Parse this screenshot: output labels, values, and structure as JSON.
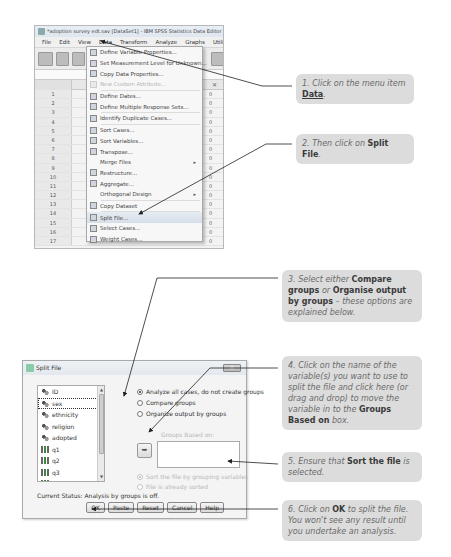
{
  "spss_window": {
    "title": "*adoption survey edt.sav [DataSet1] - IBM SPSS Statistics Data Editor",
    "menubar": [
      "File",
      "Edit",
      "View",
      "Data",
      "Transform",
      "Analyze",
      "Graphs",
      "Utilities",
      "Add-"
    ],
    "active_menu": "Data",
    "row_numbers": [
      "1",
      "2",
      "3",
      "4",
      "5",
      "6",
      "7",
      "8",
      "9",
      "10",
      "11",
      "12",
      "13",
      "14",
      "15",
      "16",
      "17"
    ],
    "row_value_suffix": "0"
  },
  "data_menu": {
    "items": [
      {
        "label": "Define Variable Properties...",
        "icon": "define-variable-icon",
        "disabled": false
      },
      {
        "label": "Set Measurement Level for Unknown...",
        "icon": "measurement-level-icon",
        "disabled": false
      },
      {
        "label": "Copy Data Properties...",
        "icon": "copy-properties-icon",
        "disabled": false
      },
      {
        "label": "New Custom Attribute...",
        "icon": "custom-attribute-icon",
        "disabled": true
      },
      {
        "label": "Define Dates...",
        "icon": "calendar-icon",
        "disabled": false
      },
      {
        "label": "Define Multiple Response Sets...",
        "icon": "multiple-response-icon",
        "disabled": false
      },
      {
        "label": "Identify Duplicate Cases...",
        "icon": "duplicate-cases-icon",
        "disabled": false
      },
      {
        "label": "Sort Cases...",
        "icon": "sort-cases-icon",
        "disabled": false
      },
      {
        "label": "Sort Variables...",
        "icon": "sort-variables-icon",
        "disabled": false
      },
      {
        "label": "Transpose...",
        "icon": "transpose-icon",
        "disabled": false
      },
      {
        "label": "Merge Files",
        "icon": "",
        "disabled": false,
        "submenu": true
      },
      {
        "label": "Restructure...",
        "icon": "restructure-icon",
        "disabled": false
      },
      {
        "label": "Aggregate...",
        "icon": "aggregate-icon",
        "disabled": false
      },
      {
        "label": "Orthogonal Design",
        "icon": "",
        "disabled": false,
        "submenu": true
      },
      {
        "label": "Copy Dataset",
        "icon": "copy-dataset-icon",
        "disabled": false
      },
      {
        "label": "Split File...",
        "icon": "split-file-icon",
        "disabled": false,
        "highlighted": true
      },
      {
        "label": "Select Cases...",
        "icon": "select-cases-icon",
        "disabled": false
      },
      {
        "label": "Weight Cases...",
        "icon": "weight-cases-icon",
        "disabled": false
      }
    ],
    "submenu_arrow": "▸"
  },
  "split_dialog": {
    "title": "Split File",
    "close_label": "✕",
    "variables": [
      {
        "name": "ID",
        "type": "nominal"
      },
      {
        "name": "sex",
        "type": "nominal",
        "selected": true
      },
      {
        "name": "ethnicity",
        "type": "nominal"
      },
      {
        "name": "religion",
        "type": "nominal"
      },
      {
        "name": "adopted",
        "type": "nominal"
      },
      {
        "name": "q1",
        "type": "scale"
      },
      {
        "name": "q2",
        "type": "scale"
      },
      {
        "name": "q3",
        "type": "scale"
      },
      {
        "name": "q4",
        "type": "scale"
      },
      {
        "name": "q5",
        "type": "scale"
      }
    ],
    "options": {
      "analyze_all": "Analyze all cases, do not create groups",
      "compare_groups": "Compare groups",
      "organize_output": "Organize output by groups"
    },
    "groups_based_on_label": "Groups Based on:",
    "move_arrow": "➥",
    "sort_options": {
      "sort_file": "Sort the file by grouping variables",
      "already_sorted": "File is already sorted"
    },
    "status": "Current Status: Analysis by groups is off.",
    "buttons": {
      "ok": "OK",
      "paste": "Paste",
      "reset": "Reset",
      "cancel": "Cancel",
      "help": "Help"
    }
  },
  "callouts": {
    "c1": {
      "text_pre": "1. Click on the menu item ",
      "bold": "Data",
      "text_post": "."
    },
    "c2": {
      "text_pre": "2. Then click on ",
      "bold": "Split File",
      "text_post": "."
    },
    "c3": {
      "text_pre": "3. Select either ",
      "bold1": "Compare groups",
      "mid": " or ",
      "bold2": "Organise output by groups",
      "text_post": " – these options are explained below."
    },
    "c4": {
      "text_pre": "4. Click on the name of the variable(s) you want to use to split the file and click here (or drag and drop) to move the variable in to the ",
      "bold": "Groups Based on",
      "text_post": " box."
    },
    "c5": {
      "text_pre": "5. Ensure that ",
      "bold": "Sort the file",
      "text_post": " is selected."
    },
    "c6": {
      "text_pre": "6. Click on ",
      "bold": "OK",
      "text_post": " to split the file. You won't see any result until you undertake an analysis."
    }
  }
}
